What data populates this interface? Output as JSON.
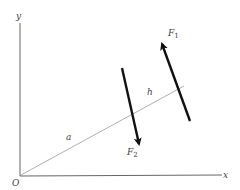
{
  "diagram": {
    "labels": {
      "y_axis": "y",
      "x_axis": "x",
      "origin": "O",
      "distance_a": "a",
      "distance_h": "h",
      "force1": "F",
      "force1_sub": "1",
      "force2": "F",
      "force2_sub": "2"
    },
    "colors": {
      "axis": "#666666",
      "line": "#888888",
      "force": "#111111",
      "text": "#444444"
    }
  }
}
